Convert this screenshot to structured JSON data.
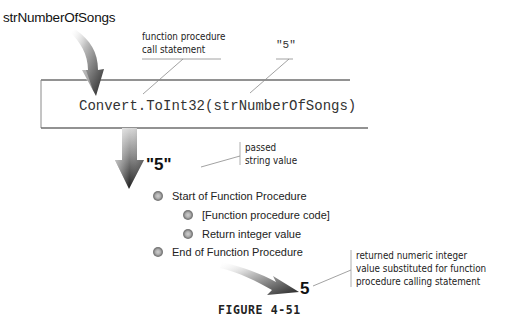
{
  "diagram": {
    "input_variable": "strNumberOfSongs",
    "callouts": {
      "call_statement": [
        "function procedure",
        "call statement"
      ],
      "argument_value": "\"5\"",
      "passed_string": [
        "passed",
        "string value"
      ],
      "returned_value": [
        "returned numeric integer",
        "value substituted for function",
        "procedure calling statement"
      ]
    },
    "code_statement": "Convert.ToInt32(strNumberOfSongs)",
    "passed_value": "\"5\"",
    "procedure_steps": [
      {
        "label": "Start of Function Procedure",
        "level": 0
      },
      {
        "label": "[Function procedure code]",
        "level": 1
      },
      {
        "label": "Return integer value",
        "level": 1
      },
      {
        "label": "End of Function Procedure",
        "level": 0
      }
    ],
    "result_value": "5",
    "figure_caption": "FIGURE 4-51"
  },
  "colors": {
    "arrow_dark": "#2a2a2a",
    "arrow_light": "#e6e6e6",
    "line": "#7a7a7a",
    "bullet": "#8a8a8a"
  }
}
